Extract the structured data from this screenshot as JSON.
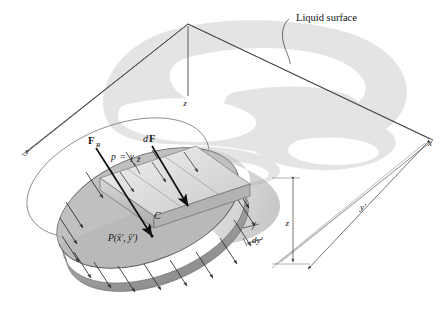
{
  "figure": {
    "title_alt": "Hydrostatic pressure distribution on a submerged inclined circular plate",
    "background_color": "#ffffff",
    "line_color": "#3a3a3a",
    "watermark_color": "#d8d8d8",
    "plate_fill": "#b9b9b9",
    "prism_fill": "#cfcfcf",
    "wedge_fill": "#e2e2e2"
  },
  "labels": {
    "liquid_surface": "Liquid surface",
    "axis_x": "x",
    "axis_y": "y",
    "axis_z": "z",
    "resultant_force": "F",
    "resultant_force_sub": "R",
    "differential_force_d": "d",
    "differential_force_F": "F",
    "pressure_eq_p": "p",
    "pressure_eq_equals": "=",
    "pressure_eq_gamma": "γ",
    "pressure_eq_zbar": "z̄",
    "centroid": "C",
    "center_of_pressure": "P(x̄', ȳ')",
    "depth_z": "z",
    "distance_yprime": "y'",
    "strip_width": "dy'"
  }
}
